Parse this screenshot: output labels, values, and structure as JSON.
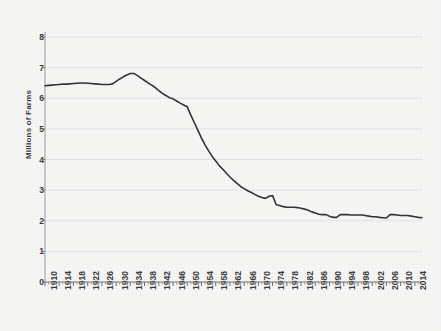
{
  "chart_data": {
    "type": "line",
    "title": "",
    "xlabel": "",
    "ylabel": "Millions of Farms",
    "xlim": [
      1910,
      2016
    ],
    "ylim": [
      0,
      8
    ],
    "yticks": [
      0,
      1,
      2,
      3,
      4,
      5,
      6,
      7,
      8
    ],
    "xticks": [
      1910,
      1914,
      1918,
      1922,
      1926,
      1930,
      1934,
      1938,
      1942,
      1946,
      1950,
      1954,
      1958,
      1962,
      1966,
      1970,
      1974,
      1978,
      1982,
      1986,
      1990,
      1994,
      1998,
      2002,
      2006,
      2010,
      2014
    ],
    "xtick_labels": [
      "1910",
      "1914",
      "1918",
      "1922",
      "1926",
      "1930",
      "1934",
      "1938",
      "1942",
      "1946",
      "1950",
      "1954",
      "1958",
      "1962",
      "1966",
      "1970",
      "1974",
      "1978",
      "1982",
      "1986",
      "1990",
      "1994",
      "1998",
      "2002",
      "2006",
      "2010",
      "2014"
    ],
    "grid": "horizontal",
    "legend": "none",
    "series": [
      {
        "name": "Number of farms",
        "color": "#333333",
        "x": [
          1910,
          1911,
          1912,
          1913,
          1914,
          1915,
          1916,
          1917,
          1918,
          1919,
          1920,
          1921,
          1922,
          1923,
          1924,
          1925,
          1926,
          1927,
          1928,
          1929,
          1930,
          1931,
          1932,
          1933,
          1934,
          1935,
          1936,
          1937,
          1938,
          1939,
          1940,
          1941,
          1942,
          1943,
          1944,
          1945,
          1946,
          1947,
          1948,
          1949,
          1950,
          1951,
          1952,
          1953,
          1954,
          1955,
          1956,
          1957,
          1958,
          1959,
          1960,
          1961,
          1962,
          1963,
          1964,
          1965,
          1966,
          1967,
          1968,
          1969,
          1970,
          1971,
          1972,
          1973,
          1974,
          1975,
          1976,
          1977,
          1978,
          1979,
          1980,
          1981,
          1982,
          1983,
          1984,
          1985,
          1986,
          1987,
          1988,
          1989,
          1990,
          1991,
          1992,
          1993,
          1994,
          1995,
          1996,
          1997,
          1998,
          1999,
          2000,
          2001,
          2002,
          2003,
          2004,
          2005,
          2006,
          2007,
          2008,
          2009,
          2010,
          2011,
          2012,
          2013,
          2014,
          2015,
          2016
        ],
        "y": [
          6.41,
          6.42,
          6.43,
          6.44,
          6.45,
          6.46,
          6.46,
          6.47,
          6.48,
          6.49,
          6.5,
          6.5,
          6.49,
          6.48,
          6.47,
          6.46,
          6.45,
          6.45,
          6.45,
          6.47,
          6.55,
          6.63,
          6.7,
          6.76,
          6.81,
          6.81,
          6.74,
          6.66,
          6.58,
          6.5,
          6.43,
          6.35,
          6.25,
          6.16,
          6.09,
          6.02,
          5.98,
          5.91,
          5.84,
          5.78,
          5.72,
          5.45,
          5.2,
          4.95,
          4.7,
          4.48,
          4.28,
          4.1,
          3.95,
          3.8,
          3.68,
          3.55,
          3.43,
          3.32,
          3.22,
          3.12,
          3.05,
          2.98,
          2.92,
          2.86,
          2.8,
          2.76,
          2.73,
          2.8,
          2.82,
          2.52,
          2.5,
          2.46,
          2.44,
          2.44,
          2.44,
          2.43,
          2.41,
          2.38,
          2.34,
          2.29,
          2.25,
          2.21,
          2.2,
          2.2,
          2.15,
          2.11,
          2.11,
          2.2,
          2.2,
          2.2,
          2.19,
          2.19,
          2.19,
          2.19,
          2.17,
          2.15,
          2.13,
          2.13,
          2.11,
          2.1,
          2.09,
          2.2,
          2.2,
          2.19,
          2.17,
          2.17,
          2.17,
          2.15,
          2.13,
          2.11,
          2.1
        ]
      }
    ]
  },
  "axes": {
    "y_axis_label": "Millions of Farms"
  }
}
